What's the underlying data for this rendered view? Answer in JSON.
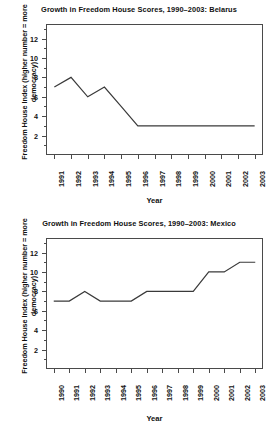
{
  "figures": [
    {
      "id": "belarus",
      "title": "Growth in Freedom House Scores, 1990–2003: Belarus",
      "xlabel": "Year",
      "ylabel_line1": "Freedom House Index (higher number = more",
      "ylabel_line2": "democracy)"
    },
    {
      "id": "mexico",
      "title": "Growth in Freedom House Scores, 1990–2003: Mexico",
      "xlabel": "Year",
      "ylabel_line1": "Freedom House Index (higher number = more",
      "ylabel_line2": "democracy)"
    }
  ],
  "chart_data": [
    {
      "type": "line",
      "title": "Growth in Freedom House Scores, 1990–2003: Belarus",
      "xlabel": "Year",
      "ylabel": "Freedom House Index (higher number = more democracy)",
      "categories": [
        "1991",
        "1992",
        "1993",
        "1994",
        "1995",
        "1996",
        "1997",
        "1998",
        "1999",
        "2000",
        "2001",
        "2002",
        "2003"
      ],
      "values": [
        7,
        8,
        6,
        7,
        5,
        3,
        3,
        3,
        3,
        3,
        3,
        3,
        3
      ],
      "xtick_labels": [
        "1991",
        "1992",
        "1993",
        "1994",
        "1995",
        "1996",
        "1997",
        "1998",
        "1999",
        "2000",
        "2001",
        "2002",
        "2003"
      ],
      "ytick_labels": [
        "2",
        "4",
        "6",
        "8",
        "10",
        "12"
      ],
      "ytick_values": [
        2,
        4,
        6,
        8,
        10,
        12
      ],
      "ylim": [
        0,
        13.5
      ],
      "grid": false,
      "legend": "none"
    },
    {
      "type": "line",
      "title": "Growth in Freedom House Scores, 1990–2003: Mexico",
      "xlabel": "Year",
      "ylabel": "Freedom House Index (higher number = more democracy)",
      "categories": [
        "1990",
        "1991",
        "1992",
        "1993",
        "1994",
        "1995",
        "1996",
        "1997",
        "1998",
        "1999",
        "2000",
        "2001",
        "2002",
        "2003"
      ],
      "values": [
        7,
        7,
        8,
        7,
        7,
        7,
        8,
        8,
        8,
        8,
        10,
        10,
        11,
        11
      ],
      "xtick_labels": [
        "1990",
        "1991",
        "1992",
        "1993",
        "1994",
        "1995",
        "1996",
        "1997",
        "1998",
        "1999",
        "2000",
        "2001",
        "2002",
        "2003"
      ],
      "ytick_labels": [
        "2",
        "4",
        "6",
        "8",
        "10",
        "12"
      ],
      "ytick_values": [
        2,
        4,
        6,
        8,
        10,
        12
      ],
      "ylim": [
        0,
        13.5
      ],
      "grid": false,
      "legend": "none"
    }
  ]
}
